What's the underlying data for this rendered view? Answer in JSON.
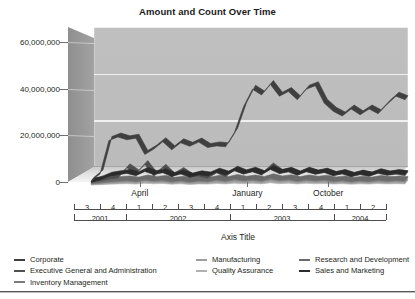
{
  "chart_data": {
    "type": "area",
    "title": "Amount and Count Over Time",
    "xlabel": "Axis Title",
    "ylabel": "",
    "ylim": [
      0,
      60000000
    ],
    "yticks": [
      0,
      20000000,
      40000000,
      60000000
    ],
    "ytick_labels": [
      "0",
      "20,000,000",
      "40,000,000",
      "60,000,000"
    ],
    "grid": true,
    "legend_position": "bottom",
    "three_d": true,
    "x_month_labels": [
      {
        "label": "April",
        "index": 8
      },
      {
        "label": "January",
        "index": 20
      },
      {
        "label": "October",
        "index": 29
      }
    ],
    "x_quarter_labels": [
      "3",
      "4",
      "1",
      "2",
      "3",
      "4",
      "1",
      "2",
      "3",
      "4",
      "1",
      "2"
    ],
    "x_year_labels": [
      "2001",
      "2002",
      "2003",
      "2004"
    ],
    "x": [
      "2001-Q3-a",
      "2001-Q3-b",
      "2001-Q3-c",
      "2001-Q4-a",
      "2001-Q4-b",
      "2001-Q4-c",
      "2002-Q1-a",
      "2002-Q1-b",
      "2002-Q1-c",
      "2002-Q2-a",
      "2002-Q2-b",
      "2002-Q2-c",
      "2002-Q3-a",
      "2002-Q3-b",
      "2002-Q3-c",
      "2002-Q4-a",
      "2002-Q4-b",
      "2002-Q4-c",
      "2003-Q1-a",
      "2003-Q1-b",
      "2003-Q1-c",
      "2003-Q2-a",
      "2003-Q2-b",
      "2003-Q2-c",
      "2003-Q3-a",
      "2003-Q3-b",
      "2003-Q3-c",
      "2003-Q4-a",
      "2003-Q4-b",
      "2003-Q4-c",
      "2004-Q1-a",
      "2004-Q1-b",
      "2004-Q1-c",
      "2004-Q2-a",
      "2004-Q2-b",
      "2004-Q2-c"
    ],
    "series": [
      {
        "name": "Corporate",
        "color": "#3f3f3f",
        "values": [
          2000000,
          5200000,
          19500000,
          21000000,
          19800000,
          20500000,
          13500000,
          15800000,
          19000000,
          15500000,
          18500000,
          17000000,
          18800000,
          16500000,
          17200000,
          16800000,
          23000000,
          34000000,
          41500000,
          39000000,
          43500000,
          38500000,
          40500000,
          37000000,
          41500000,
          43000000,
          35500000,
          32000000,
          30000000,
          33000000,
          30500000,
          33000000,
          31000000,
          35000000,
          38500000,
          37000000
        ]
      },
      {
        "name": "Executive General and Administration",
        "color": "#4f4f4f",
        "values": [
          1800000,
          2200000,
          3000000,
          3400000,
          7800000,
          5200000,
          9200000,
          4200000,
          7600000,
          3900000,
          6200000,
          3600000,
          4100000,
          3300000,
          5600000,
          4000000,
          6800000,
          5200000,
          6400000,
          4800000,
          8200000,
          5400000,
          6000000,
          4600000,
          6400000,
          5000000,
          5800000,
          4400000,
          5200000,
          4000000,
          4800000,
          4200000,
          5400000,
          4600000,
          5000000,
          4400000
        ]
      },
      {
        "name": "Inventory Management",
        "color": "#7a7a7a",
        "values": [
          900000,
          1200000,
          1600000,
          1800000,
          2100000,
          1700000,
          2400000,
          1900000,
          2200000,
          1600000,
          2000000,
          1500000,
          1900000,
          1700000,
          2300000,
          1800000,
          2600000,
          2000000,
          2400000,
          1900000,
          2800000,
          2100000,
          2500000,
          1800000,
          2400000,
          2000000,
          2300000,
          1700000,
          2100000,
          1600000,
          2000000,
          1700000,
          2200000,
          1800000,
          2100000,
          1900000
        ]
      },
      {
        "name": "Manufacturing",
        "color": "#9e9e9e",
        "values": [
          600000,
          800000,
          1100000,
          1300000,
          1500000,
          1200000,
          1700000,
          1400000,
          1600000,
          1100000,
          1400000,
          1000000,
          1300000,
          1200000,
          1600000,
          1300000,
          1800000,
          1400000,
          1700000,
          1300000,
          2000000,
          1500000,
          1800000,
          1300000,
          1700000,
          1400000,
          1600000,
          1200000,
          1500000,
          1100000,
          1400000,
          1200000,
          1600000,
          1300000,
          1500000,
          1300000
        ]
      },
      {
        "name": "Quality Assurance",
        "color": "#b0b0b0",
        "values": [
          400000,
          550000,
          750000,
          900000,
          1000000,
          820000,
          1150000,
          950000,
          1080000,
          760000,
          940000,
          700000,
          880000,
          820000,
          1080000,
          880000,
          1200000,
          940000,
          1150000,
          880000,
          1350000,
          1000000,
          1200000,
          880000,
          1150000,
          940000,
          1080000,
          820000,
          1000000,
          760000,
          940000,
          820000,
          1080000,
          880000,
          1000000,
          880000
        ]
      },
      {
        "name": "Research and Development",
        "color": "#6b6b6b",
        "values": [
          1200000,
          1500000,
          2000000,
          2300000,
          2600000,
          2100000,
          3000000,
          2400000,
          2800000,
          2000000,
          2500000,
          1900000,
          2400000,
          2100000,
          2900000,
          2300000,
          3200000,
          2500000,
          3000000,
          2400000,
          3500000,
          2600000,
          3100000,
          2300000,
          3000000,
          2500000,
          2900000,
          2200000,
          2600000,
          2000000,
          2500000,
          2100000,
          2800000,
          2300000,
          2600000,
          2400000
        ]
      },
      {
        "name": "Sales and Marketing",
        "color": "#2b2b2b",
        "values": [
          1500000,
          2600000,
          4200000,
          4800000,
          5400000,
          4400000,
          6200000,
          4900000,
          5700000,
          4100000,
          5100000,
          3800000,
          4800000,
          4300000,
          5900000,
          4700000,
          6500000,
          5100000,
          6100000,
          4800000,
          7100000,
          5300000,
          6300000,
          4700000,
          6100000,
          5100000,
          5900000,
          4500000,
          5300000,
          4100000,
          5100000,
          4300000,
          5700000,
          4700000,
          5300000,
          4900000
        ]
      }
    ]
  },
  "legend": {
    "columns": [
      {
        "items": [
          {
            "label": "Corporate",
            "color": "#3f3f3f"
          },
          {
            "label": "Executive General and Administration",
            "color": "#4f4f4f"
          },
          {
            "label": "Inventory Management",
            "color": "#7a7a7a"
          }
        ]
      },
      {
        "items": [
          {
            "label": "Manufacturing",
            "color": "#9e9e9e"
          },
          {
            "label": "Quality Assurance",
            "color": "#b0b0b0"
          }
        ]
      },
      {
        "items": [
          {
            "label": "Research and Development",
            "color": "#6b6b6b"
          },
          {
            "label": "Sales and Marketing",
            "color": "#2b2b2b"
          }
        ]
      }
    ]
  }
}
